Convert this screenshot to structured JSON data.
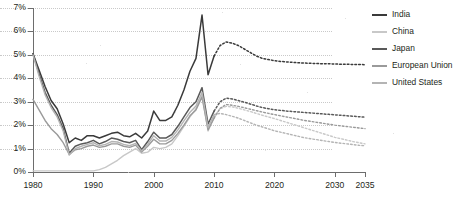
{
  "chart_data": {
    "type": "line",
    "title": "",
    "xlabel": "",
    "ylabel": "",
    "xlim": [
      1980,
      2035
    ],
    "ylim": [
      0,
      7
    ],
    "grid": true,
    "legend_position": "right",
    "y_tick_labels": [
      "0%",
      "1%",
      "2%",
      "3%",
      "4%",
      "5%",
      "6%",
      "7%"
    ],
    "y_tick_values": [
      0,
      1,
      2,
      3,
      4,
      5,
      6,
      7
    ],
    "x_tick_labels": [
      "1980",
      "1990",
      "2000",
      "2010",
      "2020",
      "2030",
      "2035"
    ],
    "x_tick_values": [
      1980,
      1990,
      2000,
      2010,
      2020,
      2030,
      2035
    ],
    "forecast_start": 2010,
    "forecast_note": "dashed segments are projections from 2010 onward",
    "x": [
      1980,
      1981,
      1982,
      1983,
      1984,
      1985,
      1986,
      1987,
      1988,
      1989,
      1990,
      1991,
      1992,
      1993,
      1994,
      1995,
      1996,
      1997,
      1998,
      1999,
      2000,
      2001,
      2002,
      2003,
      2004,
      2005,
      2006,
      2007,
      2008,
      2009,
      2010,
      2011,
      2012,
      2013,
      2014,
      2015,
      2016,
      2017,
      2018,
      2019,
      2020,
      2021,
      2022,
      2023,
      2024,
      2025,
      2026,
      2027,
      2028,
      2029,
      2030,
      2031,
      2032,
      2033,
      2034,
      2035
    ],
    "series": [
      {
        "name": "India",
        "color": "#3a3a3a",
        "values": [
          5.05,
          4.35,
          3.65,
          3.05,
          2.7,
          2.05,
          1.25,
          1.45,
          1.35,
          1.55,
          1.55,
          1.45,
          1.55,
          1.65,
          1.7,
          1.55,
          1.5,
          1.65,
          1.45,
          1.75,
          2.6,
          2.2,
          2.2,
          2.35,
          2.85,
          3.5,
          4.3,
          4.85,
          6.7,
          4.15,
          4.95,
          5.4,
          5.55,
          5.5,
          5.4,
          5.25,
          5.1,
          4.95,
          4.85,
          4.8,
          4.75,
          4.72,
          4.7,
          4.68,
          4.66,
          4.65,
          4.64,
          4.63,
          4.62,
          4.62,
          4.61,
          4.6,
          4.6,
          4.59,
          4.59,
          4.58
        ]
      },
      {
        "name": "China",
        "color": "#c8c8c8",
        "values": [
          0.05,
          0.05,
          0.05,
          0.05,
          0.05,
          0.05,
          0.05,
          0.05,
          0.05,
          0.05,
          0.05,
          0.1,
          0.2,
          0.35,
          0.5,
          0.7,
          0.85,
          1.0,
          0.8,
          0.85,
          1.05,
          1.0,
          1.05,
          1.2,
          1.55,
          1.95,
          2.35,
          2.7,
          3.3,
          1.75,
          2.35,
          2.7,
          2.8,
          2.78,
          2.72,
          2.65,
          2.58,
          2.5,
          2.42,
          2.35,
          2.28,
          2.2,
          2.12,
          2.04,
          1.96,
          1.88,
          1.8,
          1.72,
          1.64,
          1.56,
          1.48,
          1.42,
          1.36,
          1.3,
          1.25,
          1.2
        ]
      },
      {
        "name": "Japan",
        "color": "#595959",
        "values": [
          5.05,
          4.2,
          3.4,
          2.85,
          2.45,
          1.85,
          0.8,
          1.1,
          1.2,
          1.25,
          1.35,
          1.2,
          1.3,
          1.45,
          1.4,
          1.3,
          1.25,
          1.35,
          0.95,
          1.3,
          1.7,
          1.45,
          1.45,
          1.6,
          1.95,
          2.35,
          2.75,
          3.0,
          3.6,
          2.05,
          2.6,
          3.0,
          3.15,
          3.12,
          3.05,
          2.98,
          2.9,
          2.82,
          2.75,
          2.7,
          2.66,
          2.63,
          2.6,
          2.58,
          2.56,
          2.54,
          2.52,
          2.5,
          2.48,
          2.46,
          2.44,
          2.42,
          2.4,
          2.38,
          2.36,
          2.34
        ]
      },
      {
        "name": "European Union",
        "color": "#9a9a9a",
        "values": [
          3.1,
          2.65,
          2.2,
          1.85,
          1.6,
          1.25,
          0.75,
          0.95,
          1.0,
          1.1,
          1.15,
          1.05,
          1.1,
          1.2,
          1.2,
          1.1,
          1.05,
          1.15,
          0.85,
          1.1,
          1.4,
          1.2,
          1.2,
          1.35,
          1.65,
          2.0,
          2.4,
          2.65,
          3.2,
          1.8,
          2.3,
          2.72,
          2.88,
          2.85,
          2.8,
          2.74,
          2.68,
          2.62,
          2.56,
          2.5,
          2.45,
          2.4,
          2.35,
          2.3,
          2.25,
          2.2,
          2.16,
          2.12,
          2.08,
          2.04,
          2.0,
          1.97,
          1.94,
          1.91,
          1.88,
          1.85
        ]
      },
      {
        "name": "United States",
        "color": "#b4b4b4",
        "values": [
          5.0,
          4.1,
          3.3,
          2.75,
          2.35,
          1.75,
          0.72,
          1.0,
          1.1,
          1.18,
          1.25,
          1.12,
          1.18,
          1.3,
          1.28,
          1.18,
          1.12,
          1.22,
          0.9,
          1.18,
          1.55,
          1.32,
          1.32,
          1.48,
          1.8,
          2.18,
          2.55,
          2.82,
          3.4,
          1.9,
          2.45,
          2.5,
          2.45,
          2.38,
          2.3,
          2.2,
          2.1,
          2.0,
          1.92,
          1.84,
          1.76,
          1.7,
          1.64,
          1.58,
          1.52,
          1.46,
          1.42,
          1.38,
          1.34,
          1.3,
          1.26,
          1.23,
          1.2,
          1.17,
          1.14,
          1.12
        ]
      }
    ]
  },
  "legend": {
    "items": [
      {
        "label": "India",
        "color": "#3a3a3a",
        "weight": "2.4"
      },
      {
        "label": "China",
        "color": "#c8c8c8",
        "weight": "2.0"
      },
      {
        "label": "Japan",
        "color": "#595959",
        "weight": "2.4"
      },
      {
        "label": "European Union",
        "color": "#9a9a9a",
        "weight": "2.0"
      },
      {
        "label": "United States",
        "color": "#b4b4b4",
        "weight": "2.0"
      }
    ]
  }
}
